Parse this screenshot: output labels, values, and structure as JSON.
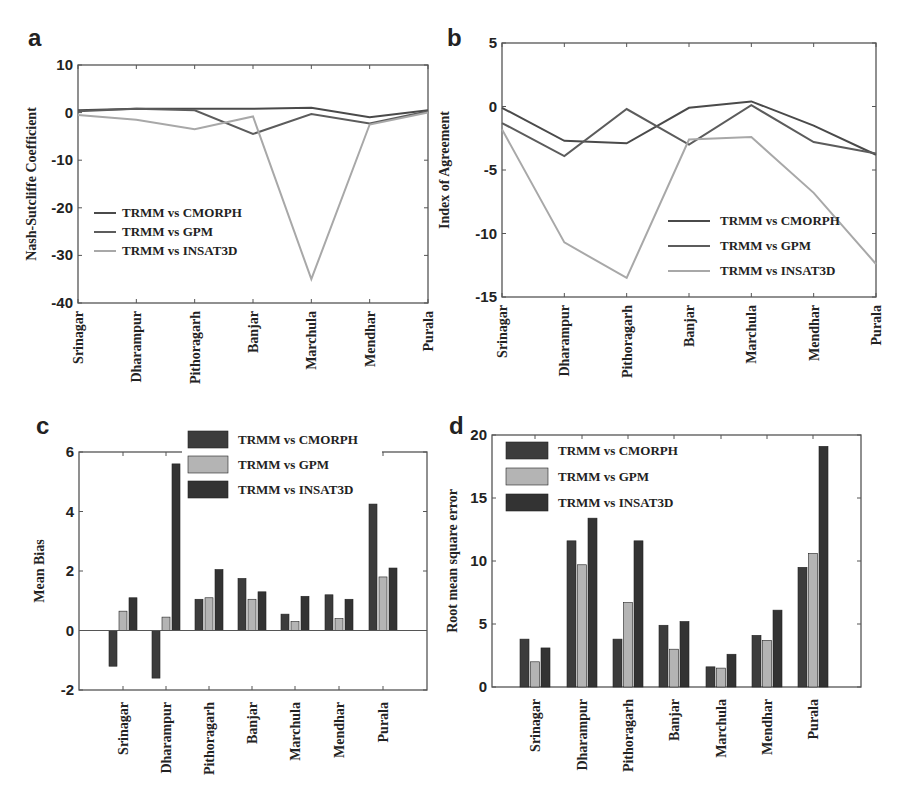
{
  "figure": {
    "panels": [
      {
        "letter": "a"
      },
      {
        "letter": "b"
      },
      {
        "letter": "c"
      },
      {
        "letter": "d"
      }
    ]
  },
  "colors": {
    "cmorph": "#4a4a4a",
    "gpm": "#5c5c5c",
    "insat3d": "#a8a8a8",
    "bar_cmorph": "#3c3c3c",
    "bar_gpm": "#b4b4b4",
    "bar_insat3d": "#333333",
    "axis": "#555555"
  },
  "chart_data": [
    {
      "panel": "a",
      "type": "line",
      "title": "",
      "xlabel": "",
      "ylabel": "Nash-Sutcliffe Coefficient",
      "ylim": [
        -40,
        10
      ],
      "yticks": [
        10,
        0,
        -10,
        -20,
        -30,
        -40
      ],
      "grid": false,
      "legend_position": "lower-left",
      "categories": [
        "Srinagar",
        "Dharampur",
        "Pithoragarh",
        "Banjar",
        "Marchula",
        "Mendhar",
        "Purala"
      ],
      "series": [
        {
          "name": "TRMM vs CMORPH",
          "values": [
            0.5,
            0.8,
            0.8,
            0.8,
            1.0,
            -1.0,
            0.5
          ]
        },
        {
          "name": "TRMM vs GPM",
          "values": [
            0.3,
            0.8,
            0.5,
            -4.5,
            -0.3,
            -2.3,
            0.3
          ]
        },
        {
          "name": "TRMM vs INSAT3D",
          "values": [
            -0.5,
            -1.5,
            -3.5,
            -0.8,
            -35.0,
            -2.5,
            0.0
          ]
        }
      ]
    },
    {
      "panel": "b",
      "type": "line",
      "title": "",
      "xlabel": "",
      "ylabel": "Index of Agreement",
      "ylim": [
        -15,
        5
      ],
      "yticks": [
        5,
        0,
        -5,
        -10,
        -15
      ],
      "grid": false,
      "legend_position": "lower-right",
      "categories": [
        "Srinagar",
        "Dharampur",
        "Pithoragarh",
        "Banjar",
        "Marchula",
        "Mendhar",
        "Purala"
      ],
      "series": [
        {
          "name": "TRMM vs CMORPH",
          "values": [
            -0.1,
            -2.7,
            -2.9,
            -0.1,
            0.4,
            -1.5,
            -3.8
          ]
        },
        {
          "name": "TRMM vs GPM",
          "values": [
            -1.3,
            -3.9,
            -0.2,
            -3.0,
            0.1,
            -2.8,
            -3.7
          ]
        },
        {
          "name": "TRMM vs INSAT3D",
          "values": [
            -1.8,
            -10.7,
            -13.5,
            -2.6,
            -2.4,
            -6.8,
            -12.4
          ]
        }
      ]
    },
    {
      "panel": "c",
      "type": "bar",
      "title": "",
      "xlabel": "",
      "ylabel": "Mean Bias",
      "ylim": [
        -2,
        6
      ],
      "yticks": [
        6,
        4,
        2,
        0,
        -2
      ],
      "grid": false,
      "legend_position": "top-right",
      "categories": [
        "Srinagar",
        "Dharampur",
        "Pithoragarh",
        "Banjar",
        "Marchula",
        "Mendhar",
        "Purala"
      ],
      "series": [
        {
          "name": "TRMM vs CMORPH",
          "values": [
            -1.2,
            -1.6,
            1.05,
            1.75,
            0.55,
            1.2,
            4.25
          ]
        },
        {
          "name": "TRMM vs GPM",
          "values": [
            0.65,
            0.45,
            1.1,
            1.05,
            0.3,
            0.4,
            1.8
          ]
        },
        {
          "name": "TRMM vs INSAT3D",
          "values": [
            1.1,
            5.6,
            2.05,
            1.3,
            1.15,
            1.05,
            2.1
          ]
        }
      ]
    },
    {
      "panel": "d",
      "type": "bar",
      "title": "",
      "xlabel": "",
      "ylabel": "Root mean square error",
      "ylim": [
        0,
        20
      ],
      "yticks": [
        20,
        15,
        10,
        5,
        0
      ],
      "grid": false,
      "legend_position": "top-left",
      "categories": [
        "Srinagar",
        "Dharampur",
        "Pithoragarh",
        "Banjar",
        "Marchula",
        "Mendhar",
        "Purala"
      ],
      "series": [
        {
          "name": "TRMM vs CMORPH",
          "values": [
            3.8,
            11.6,
            3.8,
            4.9,
            1.6,
            4.1,
            9.5
          ]
        },
        {
          "name": "TRMM vs GPM",
          "values": [
            2.0,
            9.7,
            6.7,
            3.0,
            1.5,
            3.7,
            10.6
          ]
        },
        {
          "name": "TRMM vs INSAT3D",
          "values": [
            3.1,
            13.4,
            11.6,
            5.2,
            2.6,
            6.1,
            19.1
          ]
        }
      ]
    }
  ]
}
